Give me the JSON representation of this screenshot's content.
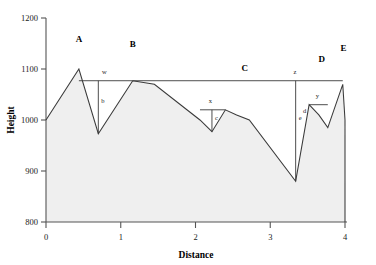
{
  "chart_data": {
    "type": "area",
    "title": "",
    "xlabel": "Distance",
    "ylabel": "Height",
    "xlim": [
      0,
      4
    ],
    "ylim": [
      800,
      1200
    ],
    "xticks": [
      "0",
      "1",
      "2",
      "3",
      "4"
    ],
    "xtick_values": [
      0,
      1,
      2,
      3,
      4
    ],
    "yticks": [
      "800",
      "900",
      "1000",
      "1100",
      "1200"
    ],
    "ytick_values": [
      800,
      900,
      1000,
      1100,
      1200
    ],
    "grid": false,
    "legend": "none",
    "fill_color": "#efefef",
    "line_color": "#3a3a3a",
    "series": [
      {
        "name": "terrain profile",
        "x": [
          0.0,
          0.44,
          0.7,
          1.16,
          1.45,
          2.06,
          2.22,
          2.4,
          2.55,
          2.72,
          3.34,
          3.52,
          3.65,
          3.77,
          3.97,
          4.0,
          4.0
        ],
        "y": [
          1000,
          1100,
          973,
          1077,
          1070,
          1000,
          977,
          1020,
          1010,
          1000,
          880,
          1030,
          1010,
          985,
          1070,
          1000,
          800
        ]
      }
    ],
    "annotations": {
      "regions": [
        {
          "id": "A",
          "label": "A",
          "x": 0.44,
          "y": 1153
        },
        {
          "id": "B",
          "label": "B",
          "x": 1.16,
          "y": 1144
        },
        {
          "id": "C",
          "label": "C",
          "x": 2.66,
          "y": 1097
        },
        {
          "id": "D",
          "label": "D",
          "x": 3.69,
          "y": 1113
        },
        {
          "id": "E",
          "label": "E",
          "x": 3.98,
          "y": 1136
        }
      ],
      "measures": [
        {
          "id": "w",
          "label": "w",
          "type": "horizontal",
          "x1": 0.44,
          "x2": 1.16,
          "y": 1077,
          "label_x": 0.78,
          "label_y": 1090
        },
        {
          "id": "b",
          "label": "b",
          "type": "vertical",
          "x": 0.7,
          "y1": 1077,
          "y2": 973,
          "label_x": 0.76,
          "label_y": 1033
        },
        {
          "id": "z",
          "label": "z",
          "type": "horizontal",
          "x1": 1.16,
          "x2": 3.97,
          "y": 1077,
          "label_x": 3.33,
          "label_y": 1090
        },
        {
          "id": "x",
          "label": "x",
          "type": "horizontal",
          "x1": 2.06,
          "x2": 2.4,
          "y": 1020,
          "label_x": 2.2,
          "label_y": 1033
        },
        {
          "id": "c",
          "label": "c",
          "type": "vertical",
          "x": 2.22,
          "y1": 1020,
          "y2": 977,
          "label_x": 2.28,
          "label_y": 1000
        },
        {
          "id": "e",
          "label": "e",
          "type": "vertical",
          "x": 3.34,
          "y1": 1077,
          "y2": 880,
          "label_x": 3.4,
          "label_y": 1000
        },
        {
          "id": "d",
          "label": "d",
          "type": "vertical",
          "x": 3.52,
          "y1": 1030,
          "y2": 1030,
          "label_x": 3.46,
          "label_y": 1013
        },
        {
          "id": "y",
          "label": "y",
          "type": "horizontal",
          "x1": 3.52,
          "x2": 3.77,
          "y": 1030,
          "label_x": 3.63,
          "label_y": 1043
        }
      ]
    }
  }
}
